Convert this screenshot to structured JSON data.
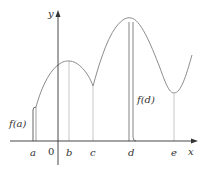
{
  "diagram": {
    "type": "function-graph",
    "axes": {
      "x_label": "x",
      "y_label": "y",
      "origin_label": "0"
    },
    "x_ticks": [
      {
        "id": "a",
        "label": "a"
      },
      {
        "id": "b",
        "label": "b"
      },
      {
        "id": "c",
        "label": "c"
      },
      {
        "id": "d",
        "label": "d"
      },
      {
        "id": "e",
        "label": "e"
      }
    ],
    "annotations": [
      {
        "id": "fa",
        "label": "f(a)",
        "at": "a"
      },
      {
        "id": "fd",
        "label": "f(d)",
        "at": "d"
      }
    ],
    "colors": {
      "axis": "#333333",
      "curve": "#8a8a8a",
      "guide_lines": "#b5b5b5",
      "text": "#333333"
    }
  }
}
